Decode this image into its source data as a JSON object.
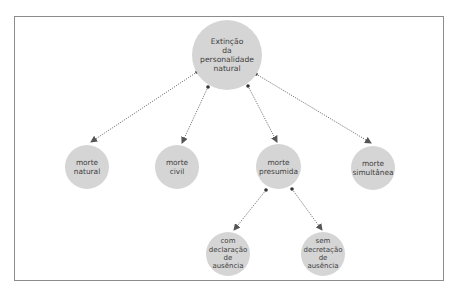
{
  "diagram": {
    "type": "tree",
    "root": {
      "id": "root",
      "label": "Extinção\nda\npersonalidade\nnatural"
    },
    "level1": [
      {
        "id": "n1",
        "label": "morte\nnatural"
      },
      {
        "id": "n2",
        "label": "morte\ncivil"
      },
      {
        "id": "n3",
        "label": "morte\npresumida"
      },
      {
        "id": "n4",
        "label": "morte\nsimultânea"
      }
    ],
    "level2": [
      {
        "id": "n31",
        "parent": "n3",
        "label": "com\ndeclaração\nde\nausência"
      },
      {
        "id": "n32",
        "parent": "n3",
        "label": "sem\ndecretação\nde\nausência"
      }
    ],
    "edges": [
      {
        "from": "root",
        "to": "n1"
      },
      {
        "from": "root",
        "to": "n2"
      },
      {
        "from": "root",
        "to": "n3"
      },
      {
        "from": "root",
        "to": "n4"
      },
      {
        "from": "n3",
        "to": "n31"
      },
      {
        "from": "n3",
        "to": "n32"
      }
    ],
    "colors": {
      "node_fill": "#d5d5d5",
      "text": "#3f3f3f",
      "edge": "#555555",
      "frame": "#8c8c8c"
    }
  }
}
